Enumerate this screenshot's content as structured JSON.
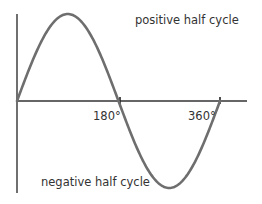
{
  "diagram": {
    "type": "sine-wave",
    "labels": {
      "positive": "positive half cycle",
      "negative": "negative half cycle",
      "tick_180": "180°",
      "tick_360": "360°"
    },
    "colors": {
      "wave": "#6e6e6e",
      "axis": "#333333",
      "text": "#333333"
    }
  },
  "chart_data": {
    "type": "line",
    "title": "",
    "xlabel": "",
    "ylabel": "",
    "x_ticks": [
      "180°",
      "360°"
    ],
    "x_range_degrees": [
      0,
      360
    ],
    "series": [
      {
        "name": "sine wave",
        "x": [
          0,
          90,
          180,
          270,
          360
        ],
        "values": [
          0,
          1,
          0,
          -1,
          0
        ]
      }
    ],
    "annotations": [
      "positive half cycle",
      "negative half cycle"
    ],
    "grid": false
  }
}
